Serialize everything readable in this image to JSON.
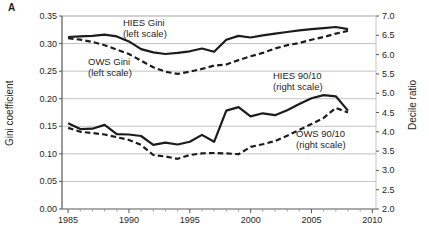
{
  "figure": {
    "panel_label": "A",
    "background": "#ffffff",
    "line_color": "#1c1c1c",
    "grid_color": "#c3c3c3",
    "axis_color": "#595959",
    "minor_tick_color": "#9a9a9a",
    "text_color": "#262626"
  },
  "chart_data": {
    "type": "line",
    "title": "",
    "xlabel": "",
    "ylabel_left": "Gini coefficient",
    "ylabel_right": "Decile ratio",
    "xlim": [
      1984.5,
      2010.3
    ],
    "ylim_left": [
      0.0,
      0.35
    ],
    "ylim_right": [
      2.0,
      7.0
    ],
    "grid": "horizontal",
    "legend_position": "none",
    "x_tick_labels": [
      "1985",
      "1990",
      "1995",
      "2000",
      "2005",
      "2010"
    ],
    "x_tick_values": [
      1985,
      1990,
      1995,
      2000,
      2005,
      2010
    ],
    "x_minor_tick_step": 1,
    "y_tick_labels_left": [
      "0.00",
      "0.05",
      "0.10",
      "0.15",
      "0.20",
      "0.25",
      "0.30",
      "0.35"
    ],
    "y_tick_values_left": [
      0.0,
      0.05,
      0.1,
      0.15,
      0.2,
      0.25,
      0.3,
      0.35
    ],
    "y_tick_labels_right": [
      "2.0",
      "2.5",
      "3.0",
      "3.5",
      "4.0",
      "4.5",
      "5.0",
      "5.5",
      "6.0",
      "6.5",
      "7.0"
    ],
    "y_tick_values_right": [
      2.0,
      2.5,
      3.0,
      3.5,
      4.0,
      4.5,
      5.0,
      5.5,
      6.0,
      6.5,
      7.0
    ],
    "x": [
      1985,
      1986,
      1987,
      1988,
      1989,
      1990,
      1991,
      1992,
      1993,
      1994,
      1995,
      1996,
      1997,
      1998,
      1999,
      2000,
      2001,
      2002,
      2003,
      2004,
      2005,
      2006,
      2007,
      2008
    ],
    "series": [
      {
        "name": "HIES Gini",
        "axis": "left",
        "style": "solid",
        "values": [
          0.312,
          0.313,
          0.314,
          0.316,
          0.313,
          0.304,
          0.29,
          0.284,
          0.281,
          0.283,
          0.286,
          0.291,
          0.285,
          0.307,
          0.314,
          0.311,
          0.315,
          0.318,
          0.321,
          0.324,
          0.326,
          0.328,
          0.33,
          0.326
        ]
      },
      {
        "name": "OWS Gini",
        "axis": "left",
        "style": "dashed",
        "values": [
          0.31,
          0.307,
          0.303,
          0.297,
          0.289,
          0.281,
          0.269,
          0.257,
          0.249,
          0.245,
          0.249,
          0.254,
          0.26,
          0.262,
          0.27,
          0.277,
          0.283,
          0.291,
          0.297,
          0.301,
          0.307,
          0.312,
          0.318,
          0.323
        ]
      },
      {
        "name": "HIES 90/10",
        "axis": "right",
        "style": "solid",
        "values": [
          4.22,
          4.07,
          4.08,
          4.18,
          3.94,
          3.93,
          3.89,
          3.66,
          3.72,
          3.67,
          3.74,
          3.92,
          3.74,
          4.55,
          4.64,
          4.4,
          4.48,
          4.43,
          4.56,
          4.72,
          4.87,
          4.95,
          4.92,
          4.55
        ]
      },
      {
        "name": "OWS 90/10",
        "axis": "right",
        "style": "dashed",
        "values": [
          4.1,
          4.0,
          3.97,
          3.93,
          3.86,
          3.79,
          3.66,
          3.4,
          3.36,
          3.3,
          3.4,
          3.44,
          3.45,
          3.44,
          3.42,
          3.61,
          3.68,
          3.76,
          3.9,
          4.05,
          4.2,
          4.36,
          4.62,
          4.5
        ]
      }
    ],
    "annotations": [
      {
        "lines": [
          "HIES Gini",
          "(left scale)"
        ],
        "x": 123,
        "y": 26
      },
      {
        "lines": [
          "OWS Gini",
          "(left scale)"
        ],
        "x": 88,
        "y": 65
      },
      {
        "lines": [
          "HIES 90/10",
          "(right scale)"
        ],
        "x": 273,
        "y": 79
      },
      {
        "lines": [
          "OWS 90/10",
          "(right scale)"
        ],
        "x": 296,
        "y": 137
      }
    ]
  }
}
